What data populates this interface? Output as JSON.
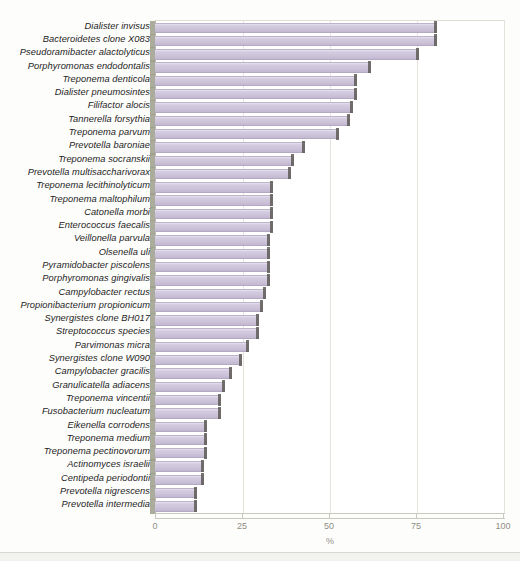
{
  "chart_data": {
    "type": "bar",
    "orientation": "horizontal",
    "title": "",
    "subtitle": "",
    "xlabel": "%",
    "ylabel": "",
    "xlim": [
      0,
      100
    ],
    "xticks": [
      0,
      25,
      50,
      75,
      100
    ],
    "xtick_labels": [
      "0",
      "25",
      "50",
      "75",
      "100"
    ],
    "grid": true,
    "grid_axis": "x",
    "legend": null,
    "legend_position": "none",
    "bar_color": "#cdc4da",
    "bar_edge_color": "#b3a9c2",
    "bar_cap_color": "#5f5a57",
    "bar_shoulder_color": "#9d9d8c",
    "grid_color": "#e4e4dd",
    "axis_text_color": "#8f8f86",
    "label_text_color": "#1d1d1d",
    "categories": [
      "Dialister invisus",
      "Bacteroidetes clone X083",
      "Pseudoramibacter alactolyticus",
      "Porphyromonas endodontalis",
      "Treponema denticola",
      "Dialister pneumosintes",
      "Filifactor alocis",
      "Tannerella forsythia",
      "Treponema parvum",
      "Prevotella baroniae",
      "Treponema socranskii",
      "Prevotella multisaccharivorax",
      "Treponema lecithinolyticum",
      "Treponema maltophilum",
      "Catonella morbi",
      "Enterococcus faecalis",
      "Veillonella parvula",
      "Olsenella uli",
      "Pyramidobacter piscolens",
      "Porphyromonas gingivalis",
      "Campylobacter rectus",
      "Propionibacterium propionicum",
      "Synergistes clone BH017",
      "Streptococcus species",
      "Parvimonas micra",
      "Synergistes clone W090",
      "Campylobacter gracilis",
      "Granulicatella adiacens",
      "Treponema vincentii",
      "Fusobacterium nucleatum",
      "Eikenella corrodens",
      "Treponema medium",
      "Treponema pectinovorum",
      "Actinomyces israelii",
      "Centipeda periodontii",
      "Prevotella nigrescens",
      "Prevotella intermedia"
    ],
    "values": [
      81,
      81,
      76,
      62,
      58,
      58,
      57,
      56,
      53,
      43,
      40,
      39,
      34,
      34,
      34,
      34,
      33,
      33,
      33,
      33,
      32,
      31,
      30,
      30,
      27,
      25,
      22,
      20,
      19,
      19,
      15,
      15,
      15,
      14,
      14,
      12,
      12
    ]
  }
}
